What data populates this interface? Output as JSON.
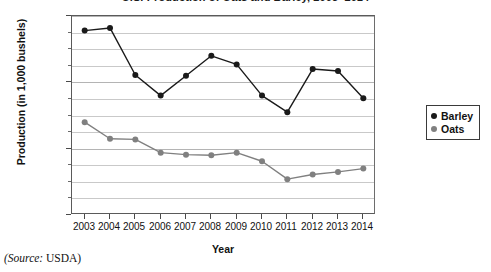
{
  "chart_data": {
    "type": "line",
    "title": "U.S. Production of Oats and Barley, 2003–2014",
    "xlabel": "Year",
    "ylabel": "Production (in 1,000 bushels)",
    "categories": [
      "2003",
      "2004",
      "2005",
      "2006",
      "2007",
      "2008",
      "2009",
      "2010",
      "2011",
      "2012",
      "2013",
      "2014"
    ],
    "x": [
      2003,
      2004,
      2005,
      2006,
      2007,
      2008,
      2009,
      2010,
      2011,
      2012,
      2013,
      2014
    ],
    "series": [
      {
        "name": "Barley",
        "color": "#1a1a1a",
        "values": [
          278000,
          282000,
          211000,
          180000,
          210000,
          240000,
          227000,
          180000,
          155000,
          220000,
          217000,
          176000
        ]
      },
      {
        "name": "Oats",
        "color": "#808080",
        "values": [
          140000,
          115000,
          114000,
          94000,
          91000,
          90000,
          94000,
          81000,
          54000,
          61000,
          65000,
          70000
        ]
      }
    ],
    "ylim": [
      0,
      300000
    ],
    "xlim": [
      2002.5,
      2014.5
    ],
    "y_ticks_major": [
      0,
      100000,
      200000,
      300000
    ],
    "y_tick_labels": [
      "0",
      "100,000",
      "200,000",
      "300,000"
    ],
    "y_gridline_step": 25000,
    "grid": true,
    "legend_position": "right",
    "legend": [
      "Barley",
      "Oats"
    ],
    "source_prefix": "(Source:",
    "source_value": "USDA)"
  }
}
